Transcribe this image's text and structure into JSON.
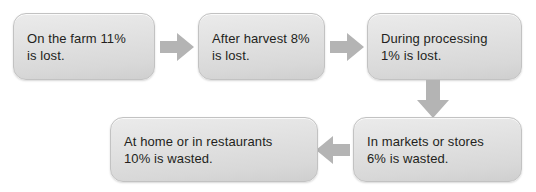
{
  "diagram": {
    "background_color": "#ffffff",
    "node_fill_top": "#ebebeb",
    "node_fill_bottom": "#cfcfcf",
    "node_border_color": "#c2c2c2",
    "arrow_color": "#b4b4b4",
    "text_color": "#231f20",
    "nodes": [
      {
        "id": "on-the-farm",
        "label": "On the farm 11%\nis lost.",
        "stage": "On the farm",
        "percent": "11%",
        "outcome": "is lost."
      },
      {
        "id": "after-harvest",
        "label": "After harvest 8%\nis lost.",
        "stage": "After harvest",
        "percent": "8%",
        "outcome": "is lost."
      },
      {
        "id": "during-processing",
        "label": "During processing\n1% is lost.",
        "stage": "During processing",
        "percent": "1%",
        "outcome": "is lost."
      },
      {
        "id": "in-markets-or-stores",
        "label": "In markets or stores\n6% is wasted.",
        "stage": "In markets or stores",
        "percent": "6%",
        "outcome": "is wasted."
      },
      {
        "id": "at-home-or-in-restaurants",
        "label": "At home or in restaurants\n10% is wasted.",
        "stage": "At home or in restaurants",
        "percent": "10%",
        "outcome": "is wasted."
      }
    ],
    "connectors": [
      {
        "id": "farm-to-harvest",
        "direction": "right",
        "icon": "arrow-right-icon"
      },
      {
        "id": "harvest-to-processing",
        "direction": "right",
        "icon": "arrow-right-icon"
      },
      {
        "id": "processing-to-markets",
        "direction": "down",
        "icon": "arrow-down-icon"
      },
      {
        "id": "markets-to-home",
        "direction": "left",
        "icon": "arrow-left-icon"
      }
    ]
  }
}
